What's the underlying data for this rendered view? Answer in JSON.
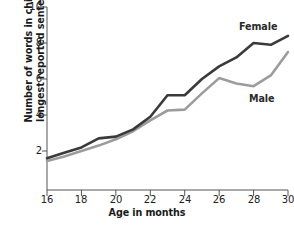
{
  "chart_data": {
    "type": "line",
    "title": "",
    "xlabel": "Age in months",
    "ylabel": "Number of words in child's longest reported sentence",
    "xlim": [
      16,
      30
    ],
    "ylim": [
      0,
      10
    ],
    "xticks": [
      16,
      18,
      20,
      22,
      24,
      26,
      28,
      30
    ],
    "yticks": [
      2,
      4,
      6,
      8,
      10
    ],
    "grid": false,
    "legend_position": "inline-at-line-ends",
    "x": [
      16,
      17,
      18,
      19,
      20,
      21,
      22,
      23,
      24,
      25,
      26,
      27,
      28,
      29,
      30
    ],
    "series": [
      {
        "name": "Female",
        "color": "#3a3a3a",
        "values": [
          1.6,
          1.9,
          2.2,
          2.7,
          2.8,
          3.2,
          3.9,
          5.1,
          5.1,
          6.0,
          6.7,
          7.2,
          8.0,
          7.9,
          8.4
        ]
      },
      {
        "name": "Male",
        "color": "#9c9c9c",
        "values": [
          1.45,
          1.7,
          2.0,
          2.3,
          2.65,
          3.1,
          3.7,
          4.25,
          4.3,
          5.2,
          6.05,
          5.75,
          5.6,
          6.2,
          7.5
        ]
      }
    ],
    "annotations": [
      {
        "text": "Female",
        "x": 29.2,
        "y": 9.2
      },
      {
        "text": "Male",
        "x": 28.7,
        "y": 5.1
      }
    ]
  },
  "axis": {
    "y_tick_labels": [
      "10",
      "8",
      "6",
      "4",
      "2"
    ],
    "x_tick_labels": [
      "16",
      "18",
      "20",
      "22",
      "24",
      "26",
      "28",
      "30"
    ],
    "y_title": "Number of words in child's longest reported sentence",
    "x_title": "Age in months"
  },
  "legend": {
    "female_label": "Female",
    "male_label": "Male"
  }
}
